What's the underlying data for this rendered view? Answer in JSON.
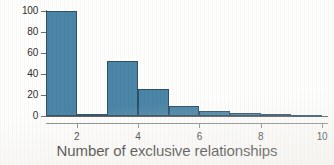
{
  "chart_data": {
    "type": "bar",
    "title": "",
    "xlabel": "Number of exclusive relationships",
    "ylabel": "",
    "categories": [
      "1",
      "2",
      "3",
      "4",
      "5",
      "6",
      "7",
      "8",
      "9"
    ],
    "bin_edges": [
      1,
      2,
      3,
      4,
      5,
      6,
      7,
      8,
      9,
      10
    ],
    "values": [
      100,
      2,
      52,
      26,
      10,
      5,
      3,
      2,
      1
    ],
    "xlim": [
      1,
      10
    ],
    "ylim": [
      0,
      100
    ],
    "xticks": [
      "2",
      "4",
      "6",
      "8",
      "10"
    ],
    "xtick_values": [
      2,
      4,
      6,
      8,
      10
    ],
    "yticks": [
      "0",
      "20",
      "40",
      "60",
      "80",
      "100"
    ],
    "ytick_values": [
      0,
      20,
      40,
      60,
      80,
      100
    ],
    "grid": false,
    "legend": false,
    "bar_color": "#4a84a6",
    "bar_edge_color": "#2f4f63",
    "axis_color": "#6e6e6e",
    "text_color": "#1a1a1a"
  }
}
